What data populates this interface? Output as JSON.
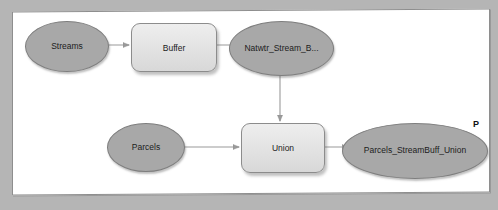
{
  "diagram": {
    "panel": {
      "background_color": "#ffffff",
      "border_color": "#8e8e8e"
    },
    "colors": {
      "data_element_fill": "#a8a8a8",
      "data_element_stroke": "#7e7e7e",
      "tool_element_fill": "#e6e6e6",
      "tool_element_stroke": "#8c8c8c",
      "connector": "#8a8a8a",
      "label_text": "#1c1c1c",
      "page_background": "#b5b5b5"
    },
    "nodes": [
      {
        "id": "streams",
        "label": "Streams",
        "shape": "ellipse",
        "kind": "input-data",
        "x": 12,
        "y": 10,
        "w": 82,
        "h": 49
      },
      {
        "id": "buffer",
        "label": "Buffer",
        "shape": "rounded-rectangle",
        "kind": "tool",
        "x": 118,
        "y": 12,
        "w": 84,
        "h": 47
      },
      {
        "id": "natwtr_stream_buff",
        "label": "Natwtr_Stream_B...",
        "shape": "ellipse",
        "kind": "derived-data",
        "x": 216,
        "y": 10,
        "w": 103,
        "h": 53
      },
      {
        "id": "parcels",
        "label": "Parcels",
        "shape": "ellipse",
        "kind": "input-data",
        "x": 94,
        "y": 112,
        "w": 76,
        "h": 47
      },
      {
        "id": "union",
        "label": "Union",
        "shape": "rounded-rectangle",
        "kind": "tool",
        "x": 228,
        "y": 112,
        "w": 82,
        "h": 48
      },
      {
        "id": "parcels_streambuff_union",
        "label": "Parcels_StreamBuff_Union",
        "shape": "ellipse",
        "kind": "output-data",
        "x": 329,
        "y": 112,
        "w": 144,
        "h": 54
      }
    ],
    "connectors": [
      {
        "id": "streams-to-buffer",
        "from": "streams",
        "to": "buffer",
        "direction": "horizontal"
      },
      {
        "id": "buffer-to-natwtr",
        "from": "buffer",
        "to": "natwtr_stream_buff",
        "direction": "horizontal"
      },
      {
        "id": "natwtr-to-union",
        "from": "natwtr_stream_buff",
        "to": "union",
        "direction": "vertical"
      },
      {
        "id": "parcels-to-union",
        "from": "parcels",
        "to": "union",
        "direction": "horizontal"
      },
      {
        "id": "union-to-output",
        "from": "union",
        "to": "parcels_streambuff_union",
        "direction": "horizontal"
      }
    ],
    "corner_mark": "P"
  }
}
